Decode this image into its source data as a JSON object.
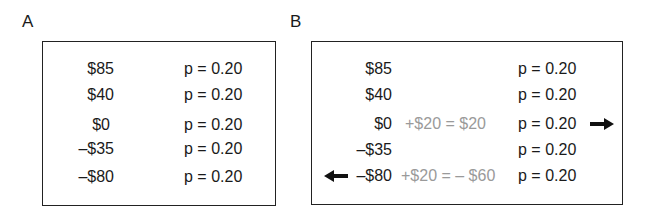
{
  "panelA": {
    "label": "A",
    "rows": [
      {
        "amount": "$85",
        "prob": "p = 0.20"
      },
      {
        "amount": "$40",
        "prob": "p = 0.20"
      },
      {
        "amount": "$0",
        "prob": "p = 0.20"
      },
      {
        "amount": "–$35",
        "prob": "p = 0.20"
      },
      {
        "amount": "–$80",
        "prob": "p = 0.20"
      }
    ]
  },
  "panelB": {
    "label": "B",
    "rows": [
      {
        "amount": "$85",
        "adjust": "",
        "prob": "p = 0.20"
      },
      {
        "amount": "$40",
        "adjust": "",
        "prob": "p = 0.20"
      },
      {
        "amount": "$0",
        "adjust": "+$20 = $20",
        "prob": "p = 0.20",
        "arrow": "right"
      },
      {
        "amount": "–$35",
        "adjust": "",
        "prob": "p = 0.20"
      },
      {
        "amount": "–$80",
        "adjust": "+$20 = – $60",
        "prob": "p = 0.20",
        "arrow": "left"
      }
    ],
    "adjust_color": "#9a9a9a"
  }
}
